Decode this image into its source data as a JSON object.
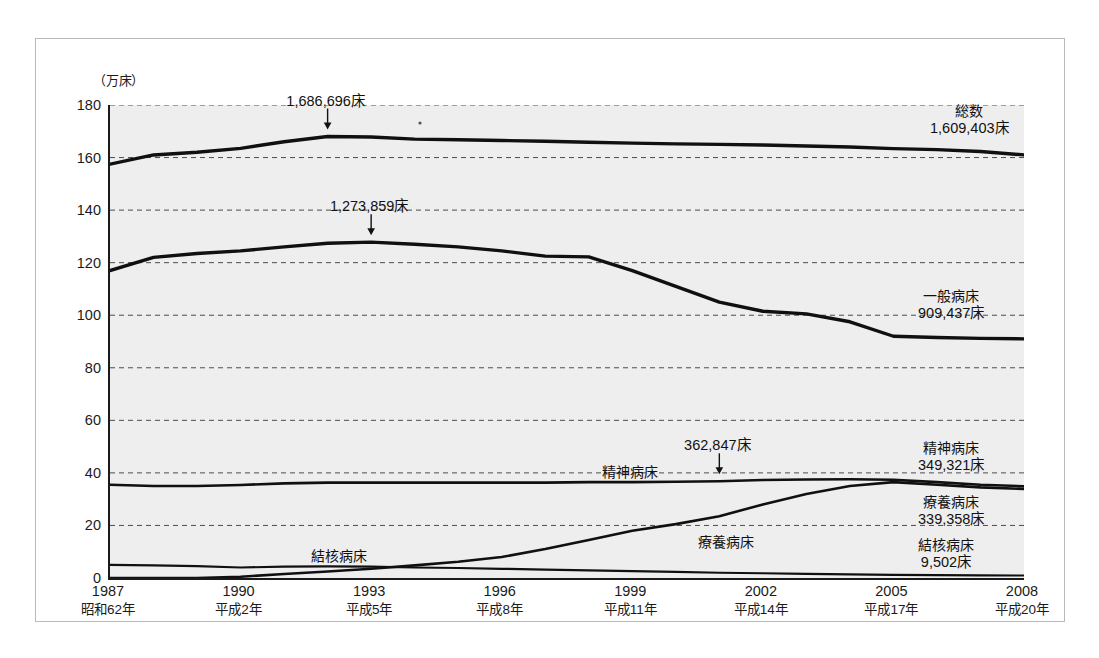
{
  "chart_data": {
    "type": "line",
    "title": "",
    "unit_label": "（万床）",
    "ylabel": "",
    "xlabel": "",
    "ylim": [
      0,
      180
    ],
    "yticks": [
      0,
      20,
      40,
      60,
      80,
      100,
      120,
      140,
      160,
      180
    ],
    "grid": true,
    "legend_position": "inline-right",
    "categories": [
      1987,
      1988,
      1989,
      1990,
      1991,
      1992,
      1993,
      1994,
      1995,
      1996,
      1997,
      1998,
      1999,
      2000,
      2001,
      2002,
      2003,
      2004,
      2005,
      2006,
      2007,
      2008
    ],
    "x_tick_years": [
      "1987",
      "1990",
      "1993",
      "1996",
      "1999",
      "2002",
      "2005",
      "2008"
    ],
    "x_tick_eras": [
      "昭和62年",
      "平成2年",
      "平成5年",
      "平成8年",
      "平成11年",
      "平成14年",
      "平成17年",
      "平成20年"
    ],
    "series": [
      {
        "name": "総数",
        "end_value_label": "1,609,403床",
        "values": [
          157.5,
          161.0,
          162.0,
          163.5,
          166.0,
          168.0,
          167.8,
          167.0,
          166.8,
          166.5,
          166.2,
          165.8,
          165.5,
          165.2,
          165.0,
          164.8,
          164.4,
          164.0,
          163.4,
          163.0,
          162.3,
          161.0
        ]
      },
      {
        "name": "一般病床",
        "end_value_label": "909,437床",
        "values": [
          117.0,
          122.0,
          123.5,
          124.5,
          126.0,
          127.4,
          127.8,
          127.0,
          126.0,
          124.5,
          122.5,
          122.2,
          117.0,
          111.0,
          105.0,
          101.5,
          100.5,
          97.5,
          92.0,
          91.5,
          91.2,
          91.0
        ]
      },
      {
        "name": "精神病床",
        "end_value_label": "349,321床",
        "values": [
          35.5,
          35.0,
          35.0,
          35.4,
          36.0,
          36.3,
          36.3,
          36.3,
          36.3,
          36.3,
          36.3,
          36.5,
          36.5,
          36.6,
          36.8,
          37.3,
          37.5,
          37.6,
          37.4,
          36.5,
          35.5,
          34.9
        ]
      },
      {
        "name": "療養病床",
        "end_value_label": "339,358床",
        "values": [
          0.0,
          0.0,
          0.0,
          0.5,
          1.5,
          2.5,
          3.5,
          4.8,
          6.2,
          8.0,
          11.0,
          14.5,
          18.0,
          20.5,
          23.5,
          28.0,
          32.0,
          35.0,
          36.5,
          35.5,
          34.5,
          33.9
        ]
      },
      {
        "name": "結核病床",
        "end_value_label": "9,502床",
        "values": [
          5.0,
          4.8,
          4.5,
          4.0,
          4.3,
          4.4,
          4.3,
          4.0,
          3.8,
          3.5,
          3.2,
          2.9,
          2.6,
          2.3,
          2.0,
          1.8,
          1.6,
          1.4,
          1.2,
          1.1,
          1.0,
          0.95
        ]
      }
    ],
    "annotations": [
      {
        "text": "1,686,696床",
        "year": 1992,
        "value": 168.0,
        "series": "総数"
      },
      {
        "text": "1,273,859床",
        "year": 1993,
        "value": 127.8,
        "series": "一般病床"
      },
      {
        "text": "362,847床",
        "year": 2001,
        "value": 36.8,
        "series": "精神病床"
      }
    ],
    "inline_labels": [
      {
        "text": "精神病床",
        "year": 1999
      },
      {
        "text": "療養病床",
        "year": 2001
      },
      {
        "text": "結核病床",
        "year": 1992
      }
    ]
  },
  "axis": {
    "ytick_labels": [
      "180",
      "160",
      "140",
      "120",
      "100",
      "80",
      "60",
      "40",
      "20",
      "0"
    ]
  },
  "right_labels": [
    {
      "name": "総数",
      "value": "1,609,403床"
    },
    {
      "name": "一般病床",
      "value": "909,437床"
    },
    {
      "name": "精神病床",
      "value": "349,321床"
    },
    {
      "name": "療養病床",
      "value": "339,358床"
    },
    {
      "name": "結核病床",
      "value": "9,502床"
    }
  ],
  "colors": {
    "line": "#101010",
    "plot_background": "#eeeeee",
    "grid": "#4d4d4d",
    "frame": "#b9b9b9"
  }
}
